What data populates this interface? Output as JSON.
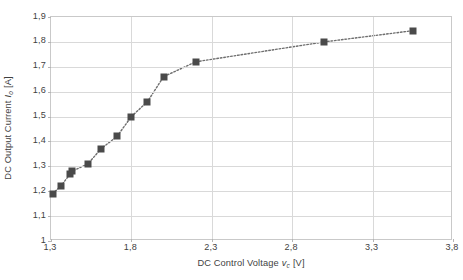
{
  "chart_data": {
    "type": "scatter",
    "title": "",
    "xlabel": "DC Control Voltage v_c [V]",
    "ylabel": "DC Output Current I_o [A]",
    "xlim": [
      1.3,
      3.8
    ],
    "ylim": [
      1.0,
      1.9
    ],
    "xticks": [
      "1,3",
      "1,8",
      "2,3",
      "2,8",
      "3,3",
      "3,8"
    ],
    "xtick_values": [
      1.3,
      1.8,
      2.3,
      2.8,
      3.3,
      3.8
    ],
    "yticks": [
      "1",
      "1,1",
      "1,2",
      "1,3",
      "1,4",
      "1,5",
      "1,6",
      "1,7",
      "1,8",
      "1,9"
    ],
    "ytick_values": [
      1.0,
      1.1,
      1.2,
      1.3,
      1.4,
      1.5,
      1.6,
      1.7,
      1.8,
      1.9
    ],
    "grid": true,
    "legend": "none",
    "marker": "square",
    "marker_color": "#4a4a4a",
    "line_style": "dotted",
    "line_color": "#6e6e6e",
    "x": [
      1.31,
      1.36,
      1.42,
      1.43,
      1.53,
      1.61,
      1.71,
      1.8,
      1.9,
      2.0,
      2.2,
      3.0,
      3.55
    ],
    "values": [
      1.19,
      1.22,
      1.27,
      1.28,
      1.31,
      1.37,
      1.42,
      1.5,
      1.56,
      1.66,
      1.72,
      1.8,
      1.845
    ],
    "points": [
      {
        "x": 1.31,
        "y": 1.19
      },
      {
        "x": 1.36,
        "y": 1.22
      },
      {
        "x": 1.42,
        "y": 1.27
      },
      {
        "x": 1.43,
        "y": 1.28
      },
      {
        "x": 1.53,
        "y": 1.31
      },
      {
        "x": 1.61,
        "y": 1.37
      },
      {
        "x": 1.71,
        "y": 1.42
      },
      {
        "x": 1.8,
        "y": 1.5
      },
      {
        "x": 1.9,
        "y": 1.56
      },
      {
        "x": 2.0,
        "y": 1.66
      },
      {
        "x": 2.2,
        "y": 1.72
      },
      {
        "x": 3.0,
        "y": 1.8
      },
      {
        "x": 3.55,
        "y": 1.845
      }
    ]
  },
  "axes": {
    "y_title": {
      "text": "DC Output Current",
      "variable": "I",
      "subscript": "o",
      "unit": "[A]"
    },
    "x_title": {
      "text": "DC Control Voltage",
      "variable": "v",
      "subscript": "c",
      "unit": "[V]"
    }
  },
  "caption": {
    "label": "",
    "text": ""
  },
  "colors": {
    "marker": "#4a4a4a",
    "line": "#6e6e6e",
    "grid": "#d9d9d9",
    "frame": "#c9c9c9",
    "text": "#3f3f3f",
    "background": "#ffffff"
  }
}
